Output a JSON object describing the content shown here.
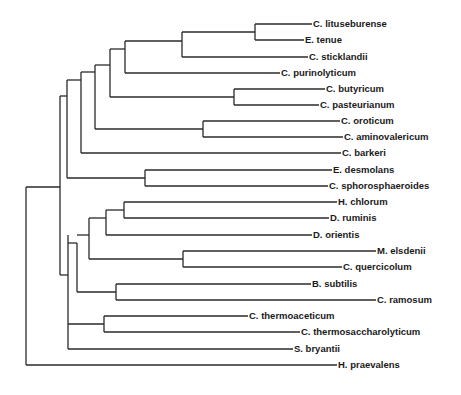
{
  "figure": {
    "type": "phylogenetic-tree",
    "orientation": "rooted, horizontal, root on left",
    "line_color": "#2a2a2a",
    "background": "#ffffff"
  },
  "leaves": [
    {
      "id": "l0",
      "label": "C. lituseburense",
      "x": 312,
      "y": 24
    },
    {
      "id": "l1",
      "label": "E. tenue",
      "x": 304,
      "y": 40
    },
    {
      "id": "l2",
      "label": "C. sticklandii",
      "x": 308,
      "y": 57
    },
    {
      "id": "l3",
      "label": "C. purinolyticum",
      "x": 280,
      "y": 73
    },
    {
      "id": "l4",
      "label": "C. butyricum",
      "x": 325,
      "y": 89
    },
    {
      "id": "l5",
      "label": "C. pasteurianum",
      "x": 319,
      "y": 105
    },
    {
      "id": "l6",
      "label": "C. oroticum",
      "x": 340,
      "y": 121
    },
    {
      "id": "l7",
      "label": "C. aminovalericum",
      "x": 343,
      "y": 137
    },
    {
      "id": "l8",
      "label": "C. barkeri",
      "x": 341,
      "y": 153
    },
    {
      "id": "l9",
      "label": "E. desmolans",
      "x": 332,
      "y": 170
    },
    {
      "id": "l10",
      "label": "C. sphorosphaeroides",
      "x": 328,
      "y": 186
    },
    {
      "id": "l11",
      "label": "H. chlorum",
      "x": 337,
      "y": 202
    },
    {
      "id": "l12",
      "label": "D. ruminis",
      "x": 329,
      "y": 218
    },
    {
      "id": "l13",
      "label": "D. orientis",
      "x": 312,
      "y": 235
    },
    {
      "id": "l14",
      "label": "M. elsdenii",
      "x": 376,
      "y": 251
    },
    {
      "id": "l15",
      "label": "C. quercicolum",
      "x": 342,
      "y": 267
    },
    {
      "id": "l16",
      "label": "B. subtilis",
      "x": 311,
      "y": 284
    },
    {
      "id": "l17",
      "label": "C. ramosum",
      "x": 376,
      "y": 300
    },
    {
      "id": "l18",
      "label": "C. thermoaceticum",
      "x": 248,
      "y": 316
    },
    {
      "id": "l19",
      "label": "C. thermosaccharolyticum",
      "x": 300,
      "y": 332
    },
    {
      "id": "l20",
      "label": "S. bryantii",
      "x": 293,
      "y": 349
    },
    {
      "id": "l21",
      "label": "H. praevalens",
      "x": 337,
      "y": 365
    }
  ],
  "nodes": [
    {
      "id": "root",
      "x": 26,
      "y1": 187,
      "y2": 365,
      "parent": null
    },
    {
      "id": "n1",
      "x": 60,
      "y1": 96,
      "y2": 275,
      "parent": "root"
    },
    {
      "id": "n2",
      "x": 67,
      "y1": 80,
      "y2": 178,
      "parent": "n1"
    },
    {
      "id": "n3",
      "x": 81,
      "y1": 72,
      "y2": 153,
      "parent": "n2"
    },
    {
      "id": "n4",
      "x": 95,
      "y1": 65,
      "y2": 129,
      "parent": "n3"
    },
    {
      "id": "n5",
      "x": 110,
      "y1": 49,
      "y2": 97,
      "parent": "n4"
    },
    {
      "id": "n6",
      "x": 125,
      "y1": 41,
      "y2": 73,
      "parent": "n5"
    },
    {
      "id": "n7",
      "x": 182,
      "y1": 32,
      "y2": 57,
      "parent": "n6"
    },
    {
      "id": "n8",
      "x": 255,
      "y1": 24,
      "y2": 40,
      "parent": "n7"
    },
    {
      "id": "n9",
      "x": 234,
      "y1": 89,
      "y2": 105,
      "parent": "n5"
    },
    {
      "id": "n10",
      "x": 203,
      "y1": 121,
      "y2": 137,
      "parent": "n4"
    },
    {
      "id": "n11",
      "x": 145,
      "y1": 170,
      "y2": 186,
      "parent": "n2"
    },
    {
      "id": "n12",
      "x": 68,
      "y1": 235,
      "y2": 349,
      "parent": "n1"
    },
    {
      "id": "n13",
      "x": 77,
      "y1": 243,
      "y2": 292,
      "parent": "n12"
    },
    {
      "id": "n14",
      "x": 89,
      "y1": 218,
      "y2": 259,
      "parent": "n13"
    },
    {
      "id": "n15",
      "x": 106,
      "y1": 210,
      "y2": 235,
      "parent": "n14"
    },
    {
      "id": "n16",
      "x": 124,
      "y1": 202,
      "y2": 218,
      "parent": "n15"
    },
    {
      "id": "n17",
      "x": 183,
      "y1": 251,
      "y2": 267,
      "parent": "n14"
    },
    {
      "id": "n18",
      "x": 116,
      "y1": 284,
      "y2": 300,
      "parent": "n13"
    },
    {
      "id": "n19",
      "x": 104,
      "y1": 316,
      "y2": 332,
      "parent": "n12"
    }
  ],
  "edges": [
    {
      "from": "root",
      "to": "n1",
      "y": 187
    },
    {
      "from": "root",
      "to": "l21",
      "y": 365
    },
    {
      "from": "n1",
      "to": "n2",
      "y": 96
    },
    {
      "from": "n1",
      "to": "n12",
      "y": 275
    },
    {
      "from": "n2",
      "to": "n3",
      "y": 80
    },
    {
      "from": "n2",
      "to": "n11",
      "y": 178
    },
    {
      "from": "n3",
      "to": "n4",
      "y": 72
    },
    {
      "from": "n3",
      "to": "l8",
      "y": 153
    },
    {
      "from": "n4",
      "to": "n5",
      "y": 65
    },
    {
      "from": "n4",
      "to": "n10",
      "y": 129
    },
    {
      "from": "n5",
      "to": "n6",
      "y": 49
    },
    {
      "from": "n5",
      "to": "n9",
      "y": 97
    },
    {
      "from": "n6",
      "to": "n7",
      "y": 41
    },
    {
      "from": "n6",
      "to": "l3",
      "y": 73
    },
    {
      "from": "n7",
      "to": "n8",
      "y": 32
    },
    {
      "from": "n7",
      "to": "l2",
      "y": 57
    },
    {
      "from": "n8",
      "to": "l0",
      "y": 24
    },
    {
      "from": "n8",
      "to": "l1",
      "y": 40
    },
    {
      "from": "n9",
      "to": "l4",
      "y": 89
    },
    {
      "from": "n9",
      "to": "l5",
      "y": 105
    },
    {
      "from": "n10",
      "to": "l6",
      "y": 121
    },
    {
      "from": "n10",
      "to": "l7",
      "y": 137
    },
    {
      "from": "n11",
      "to": "l9",
      "y": 170
    },
    {
      "from": "n11",
      "to": "l10",
      "y": 186
    },
    {
      "from": "n12",
      "to": "n13",
      "y": 243
    },
    {
      "from": "n12",
      "to": "n19",
      "y": 324
    },
    {
      "from": "n12",
      "to": "l20",
      "y": 349
    },
    {
      "from": "n13",
      "to": "n14",
      "y": 235
    },
    {
      "from": "n13",
      "to": "n18",
      "y": 292
    },
    {
      "from": "n14",
      "to": "n15",
      "y": 218
    },
    {
      "from": "n14",
      "to": "n17",
      "y": 259
    },
    {
      "from": "n15",
      "to": "n16",
      "y": 210
    },
    {
      "from": "n15",
      "to": "l13",
      "y": 235
    },
    {
      "from": "n16",
      "to": "l11",
      "y": 202
    },
    {
      "from": "n16",
      "to": "l12",
      "y": 218
    },
    {
      "from": "n17",
      "to": "l14",
      "y": 251
    },
    {
      "from": "n17",
      "to": "l15",
      "y": 267
    },
    {
      "from": "n18",
      "to": "l16",
      "y": 284
    },
    {
      "from": "n18",
      "to": "l17",
      "y": 300
    },
    {
      "from": "n19",
      "to": "l18",
      "y": 316
    },
    {
      "from": "n19",
      "to": "l19",
      "y": 332
    }
  ]
}
